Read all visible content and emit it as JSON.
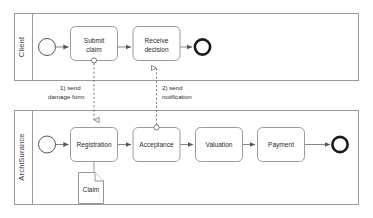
{
  "diagram": {
    "type": "bpmn-collaboration",
    "colors": {
      "pool_border": "#9a9a9a",
      "task_border": "#9a9a9a",
      "task_fill": "#ffffff",
      "sequence_flow": "#777777",
      "message_flow": "#6d6d6d",
      "end_event_border": "#1a1a1a",
      "text": "#2a2a2a",
      "background": "#ffffff"
    }
  },
  "pools": [
    {
      "id": "client",
      "label": "Client",
      "start_event": {
        "name": "start-event",
        "type": "none-start"
      },
      "end_event": {
        "name": "end-event",
        "type": "none-end"
      },
      "tasks": [
        {
          "id": "submit-claim",
          "label_line1": "Submit",
          "label_line2": "claim"
        },
        {
          "id": "receive-decision",
          "label_line1": "Receive",
          "label_line2": "decision"
        }
      ]
    },
    {
      "id": "archisurance",
      "label": "ArchiSurance",
      "start_event": {
        "name": "start-event",
        "type": "none-start"
      },
      "end_event": {
        "name": "end-event",
        "type": "none-end"
      },
      "tasks": [
        {
          "id": "registration",
          "label_line1": "Registration",
          "label_line2": ""
        },
        {
          "id": "acceptance",
          "label_line1": "Acceptance",
          "label_line2": ""
        },
        {
          "id": "valuation",
          "label_line1": "Valuation",
          "label_line2": ""
        },
        {
          "id": "payment",
          "label_line1": "Payment",
          "label_line2": ""
        }
      ],
      "data_objects": [
        {
          "id": "claim",
          "label": "Claim"
        }
      ]
    }
  ],
  "message_flows": [
    {
      "id": "send-damage-form",
      "label_line1": "1) send",
      "label_line2": "damage form",
      "from": "submit-claim",
      "to": "registration"
    },
    {
      "id": "send-notification",
      "label_line1": "2) send",
      "label_line2": "notification",
      "from": "acceptance",
      "to": "receive-decision"
    }
  ]
}
